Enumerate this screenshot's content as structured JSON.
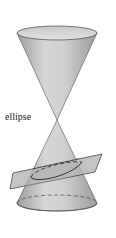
{
  "figure": {
    "type": "double-cone-conic-section",
    "labels": {
      "ellipse": "ellipse"
    },
    "colors": {
      "cone_fill_light": "#d4d4d4",
      "cone_fill_dark": "#a9a9a9",
      "plane_fill": "#b8b8b8",
      "outline": "#333333",
      "background": "#ffffff"
    }
  }
}
